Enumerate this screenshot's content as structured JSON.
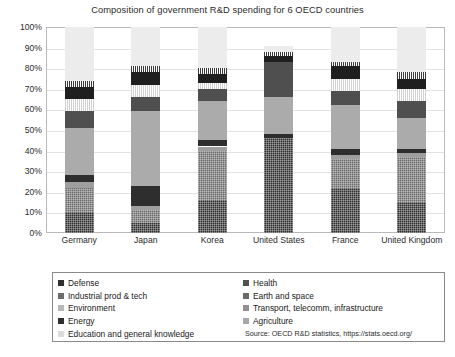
{
  "chart_data": {
    "type": "bar",
    "subtype": "100% stacked column",
    "title": "Composition of government R&D spending for 6 OECD countries",
    "xlabel": "",
    "ylabel": "",
    "ylim": [
      0,
      100
    ],
    "grid": true,
    "legend_position": "bottom",
    "categories": [
      "Germany",
      "Japan",
      "Korea",
      "United States",
      "France",
      "United Kingdom"
    ],
    "y_ticks": [
      "0%",
      "10%",
      "20%",
      "30%",
      "40%",
      "50%",
      "60%",
      "70%",
      "80%",
      "90%",
      "100%"
    ],
    "y_tick_values": [
      0,
      10,
      20,
      30,
      40,
      50,
      60,
      70,
      80,
      90,
      100
    ],
    "series": [
      {
        "name": "Defense",
        "color": "#2e2e2e",
        "pattern": "checker",
        "values": [
          10,
          5,
          16,
          46,
          22,
          15
        ]
      },
      {
        "name": "Industrial prod & tech",
        "color": "#6b6b6b",
        "pattern": "checker",
        "values": [
          12,
          6,
          24,
          0,
          14,
          22
        ]
      },
      {
        "name": "Environment",
        "color": "#9e9e9e",
        "pattern": "solid",
        "values": [
          3,
          2,
          2,
          0,
          2,
          2
        ]
      },
      {
        "name": "Energy",
        "color": "#2e2e2e",
        "pattern": "solid",
        "values": [
          3,
          10,
          3,
          2,
          3,
          2
        ]
      },
      {
        "name": "Education and general knowledge",
        "color": "#ababab",
        "pattern": "solid",
        "values": [
          23,
          36,
          19,
          18,
          21,
          15
        ]
      },
      {
        "name": "Health",
        "color": "#4f4f4f",
        "pattern": "solid",
        "values": [
          8,
          7,
          6,
          17,
          7,
          8
        ]
      },
      {
        "name": "Earth and space",
        "color": "#d2d2d2",
        "pattern": "vstripe",
        "values": [
          6,
          6,
          3,
          0,
          6,
          6
        ]
      },
      {
        "name": "Transport, telecomm, infrastructure",
        "color": "#1f1f1f",
        "pattern": "solid",
        "values": [
          6,
          6,
          4,
          3,
          6,
          5
        ]
      },
      {
        "name": "Agriculture",
        "color": "#3a3a3a",
        "pattern": "vstripe",
        "values": [
          3,
          3,
          3,
          2,
          2,
          3
        ]
      },
      {
        "name": "Unallocated",
        "color": "#ececec",
        "pattern": "solid",
        "values": [
          26,
          19,
          20,
          3,
          17,
          22
        ]
      }
    ],
    "source": "Source: OECD R&D statistics, https://stats.oecd.org/"
  },
  "legend": {
    "left_column": [
      {
        "label": "Defense",
        "color": "#2e2e2e"
      },
      {
        "label": "Industrial prod & tech",
        "color": "#6b6b6b"
      },
      {
        "label": "Environment",
        "color": "#b8b8b8"
      },
      {
        "label": "Energy",
        "color": "#2e2e2e"
      },
      {
        "label": "Education and general knowledge",
        "color": "#dcdcdc"
      }
    ],
    "right_column": [
      {
        "label": "Health",
        "color": "#4f4f4f"
      },
      {
        "label": "Earth and space",
        "color": "#6b6b6b"
      },
      {
        "label": "Transport, telecomm, infrastructure",
        "color": "#8f8f8f"
      },
      {
        "label": "Agriculture",
        "color": "#a8a8a8"
      }
    ],
    "source": "Source: OECD R&D statistics, https://stats.oecd.org/"
  }
}
